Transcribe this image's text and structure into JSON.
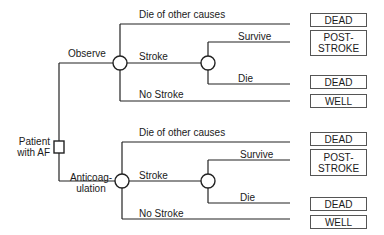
{
  "root": {
    "label_line1": "Patient",
    "label_line2": "with AF",
    "node_type": "decision"
  },
  "strategies": [
    {
      "label": "Observe",
      "branches": {
        "other": "Die of other causes",
        "stroke": "Stroke",
        "no_stroke": "No Stroke",
        "survive": "Survive",
        "die": "Die"
      },
      "outcomes": {
        "other": "DEAD",
        "survive_line1": "POST-",
        "survive_line2": "STROKE",
        "die": "DEAD",
        "no_stroke": "WELL"
      }
    },
    {
      "label_line1": "Anticoag-",
      "label_line2": "ulation",
      "branches": {
        "other": "Die of other causes",
        "stroke": "Stroke",
        "no_stroke": "No Stroke",
        "survive": "Survive",
        "die": "Die"
      },
      "outcomes": {
        "other": "DEAD",
        "survive_line1": "POST-",
        "survive_line2": "STROKE",
        "die": "DEAD",
        "no_stroke": "WELL"
      }
    }
  ],
  "colors": {
    "line": "#222222",
    "box_border": "#555555",
    "text": "#1a1a1a"
  }
}
